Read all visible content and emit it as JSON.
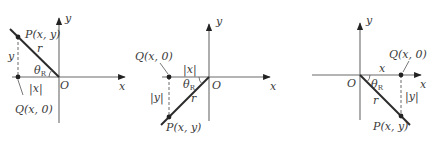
{
  "figure": {
    "panels": [
      {
        "id": "quadrant-2",
        "origin_label": "O",
        "x_axis_label": "x",
        "y_axis_label": "y",
        "point_p_label": "P(x, y)",
        "point_q_label": "Q(x, 0)",
        "radius_label": "r",
        "angle_label": "θ",
        "angle_sub": "R",
        "horizontal_leg_label": "|x|",
        "vertical_leg_label": "y"
      },
      {
        "id": "quadrant-3",
        "origin_label": "O",
        "x_axis_label": "x",
        "y_axis_label": "y",
        "point_p_label": "P(x, y)",
        "point_q_label": "Q(x, 0)",
        "radius_label": "r",
        "angle_label": "θ",
        "angle_sub": "R",
        "horizontal_leg_label": "|x|",
        "vertical_leg_label": "|y|"
      },
      {
        "id": "quadrant-4",
        "origin_label": "O",
        "x_axis_label": "x",
        "y_axis_label": "y",
        "point_p_label": "P(x, y)",
        "point_q_label": "Q(x, 0)",
        "radius_label": "r",
        "angle_label": "θ",
        "angle_sub": "R",
        "horizontal_leg_label": "x",
        "vertical_leg_label": "|y|"
      }
    ],
    "colors": {
      "axis": "#6b6b6b",
      "ray": "#2b2b2b",
      "text": "#3a3a3a"
    }
  }
}
